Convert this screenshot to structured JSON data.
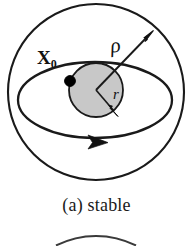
{
  "figure": {
    "caption": "(a) stable",
    "labels": {
      "point": "X",
      "point_subscript": "0",
      "outer_radius": "ρ",
      "inner_radius": "r"
    },
    "colors": {
      "stroke": "#1a1a1a",
      "inner_disk_fill": "#c8c8c8",
      "background": "#ffffff",
      "point_fill": "#000000"
    },
    "geometry": {
      "outer_circle": {
        "cx": 96,
        "cy": 92,
        "r": 88
      },
      "inner_disk": {
        "cx": 96,
        "cy": 90,
        "r": 27
      },
      "orbit_ellipse": {
        "cx": 95,
        "cy": 100,
        "rx": 77,
        "ry": 38
      },
      "point_x0": {
        "cx": 70,
        "cy": 81,
        "r": 5
      },
      "rho_arrow": {
        "x1": 96,
        "y1": 90,
        "x2": 152,
        "y2": 32
      },
      "r_arrow": {
        "x1": 96,
        "y1": 90,
        "x2": 116,
        "y2": 114
      },
      "orbit_arrow": {
        "x": 97,
        "y": 143,
        "direction": "right"
      },
      "next_figure_arc": {
        "cx": 96,
        "cy": 286,
        "r": 88
      }
    }
  }
}
